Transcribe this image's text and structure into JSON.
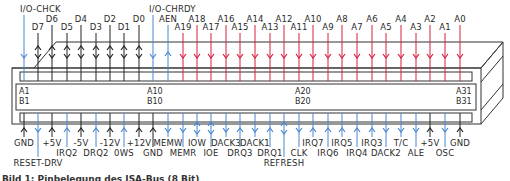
{
  "colors": {
    "output_red": "#d6203f",
    "input_blue": "#4a86d0",
    "bidir_black": "#222222",
    "outline": "#333333"
  },
  "top_pins": [
    {
      "label": "I/O-CHCK",
      "x": 24,
      "labelY": 12,
      "dir": "in",
      "color": "blue"
    },
    {
      "label": "D7",
      "x": 38,
      "labelY": 30,
      "dir": "bi",
      "color": "black"
    },
    {
      "label": "D6",
      "x": 52,
      "labelY": 22,
      "dir": "bi",
      "color": "black"
    },
    {
      "label": "D5",
      "x": 67,
      "labelY": 30,
      "dir": "bi",
      "color": "black"
    },
    {
      "label": "D4",
      "x": 81,
      "labelY": 22,
      "dir": "bi",
      "color": "black"
    },
    {
      "label": "D3",
      "x": 96,
      "labelY": 30,
      "dir": "bi",
      "color": "black"
    },
    {
      "label": "D2",
      "x": 110,
      "labelY": 22,
      "dir": "bi",
      "color": "black"
    },
    {
      "label": "D1",
      "x": 124,
      "labelY": 30,
      "dir": "bi",
      "color": "black"
    },
    {
      "label": "D0",
      "x": 139,
      "labelY": 22,
      "dir": "bi",
      "color": "black"
    },
    {
      "label": "I/O-CHRDY",
      "x": 153,
      "labelY": 12,
      "dir": "in",
      "color": "blue"
    },
    {
      "label": "AEN",
      "x": 168,
      "labelY": 22,
      "dir": "out-up",
      "color": "blue"
    },
    {
      "label": "A19",
      "x": 183,
      "labelY": 30,
      "dir": "out",
      "color": "red"
    },
    {
      "label": "A18",
      "x": 197,
      "labelY": 22,
      "dir": "out",
      "color": "red"
    },
    {
      "label": "A17",
      "x": 211,
      "labelY": 30,
      "dir": "out",
      "color": "red"
    },
    {
      "label": "A16",
      "x": 226,
      "labelY": 22,
      "dir": "out",
      "color": "red"
    },
    {
      "label": "A15",
      "x": 240,
      "labelY": 30,
      "dir": "out",
      "color": "red"
    },
    {
      "label": "A14",
      "x": 255,
      "labelY": 22,
      "dir": "out",
      "color": "red"
    },
    {
      "label": "A13",
      "x": 270,
      "labelY": 30,
      "dir": "out",
      "color": "red"
    },
    {
      "label": "A12",
      "x": 284,
      "labelY": 22,
      "dir": "out",
      "color": "red"
    },
    {
      "label": "A11",
      "x": 299,
      "labelY": 30,
      "dir": "out",
      "color": "red"
    },
    {
      "label": "A10",
      "x": 313,
      "labelY": 22,
      "dir": "out",
      "color": "red"
    },
    {
      "label": "A9",
      "x": 328,
      "labelY": 30,
      "dir": "out",
      "color": "red"
    },
    {
      "label": "A8",
      "x": 342,
      "labelY": 22,
      "dir": "out",
      "color": "red"
    },
    {
      "label": "A7",
      "x": 357,
      "labelY": 30,
      "dir": "out",
      "color": "red"
    },
    {
      "label": "A6",
      "x": 372,
      "labelY": 22,
      "dir": "out",
      "color": "red"
    },
    {
      "label": "A5",
      "x": 386,
      "labelY": 30,
      "dir": "out",
      "color": "red"
    },
    {
      "label": "A4",
      "x": 401,
      "labelY": 22,
      "dir": "out",
      "color": "red"
    },
    {
      "label": "A3",
      "x": 416,
      "labelY": 30,
      "dir": "out",
      "color": "red"
    },
    {
      "label": "A2",
      "x": 430,
      "labelY": 22,
      "dir": "out",
      "color": "red"
    },
    {
      "label": "A1",
      "x": 445,
      "labelY": 30,
      "dir": "out",
      "color": "red"
    },
    {
      "label": "A0",
      "x": 460,
      "labelY": 22,
      "dir": "out",
      "color": "red"
    }
  ],
  "bottom_pins": [
    {
      "label": "GND",
      "x": 24,
      "labelY": 146,
      "dir": "pwr",
      "color": "black"
    },
    {
      "label": "RESET-DRV",
      "x": 38,
      "labelY": 166,
      "dir": "down",
      "color": "blue"
    },
    {
      "label": "+5V",
      "x": 52,
      "labelY": 146,
      "dir": "pwr",
      "color": "black"
    },
    {
      "label": "IRQ2",
      "x": 67,
      "labelY": 156,
      "dir": "up",
      "color": "blue"
    },
    {
      "label": "-5V",
      "x": 81,
      "labelY": 146,
      "dir": "pwr",
      "color": "black"
    },
    {
      "label": "DRQ2",
      "x": 96,
      "labelY": 156,
      "dir": "up",
      "color": "blue"
    },
    {
      "label": "-12V",
      "x": 110,
      "labelY": 146,
      "dir": "pwr",
      "color": "black"
    },
    {
      "label": "0WS",
      "x": 124,
      "labelY": 156,
      "dir": "up",
      "color": "blue"
    },
    {
      "label": "+12V",
      "x": 139,
      "labelY": 146,
      "dir": "pwr",
      "color": "black"
    },
    {
      "label": "GND",
      "x": 153,
      "labelY": 156,
      "dir": "pwr",
      "color": "black"
    },
    {
      "label": "MEMW",
      "x": 168,
      "labelY": 146,
      "dir": "down",
      "color": "blue"
    },
    {
      "label": "MEMR",
      "x": 183,
      "labelY": 156,
      "dir": "down",
      "color": "blue"
    },
    {
      "label": "IOW",
      "x": 197,
      "labelY": 146,
      "dir": "bi",
      "color": "blue"
    },
    {
      "label": "IOE",
      "x": 211,
      "labelY": 156,
      "dir": "bi",
      "color": "blue"
    },
    {
      "label": "DACK3",
      "x": 226,
      "labelY": 146,
      "dir": "down",
      "color": "blue"
    },
    {
      "label": "DRQ3",
      "x": 240,
      "labelY": 156,
      "dir": "up",
      "color": "blue"
    },
    {
      "label": "DACK1",
      "x": 255,
      "labelY": 146,
      "dir": "down",
      "color": "blue"
    },
    {
      "label": "DRQ1",
      "x": 270,
      "labelY": 156,
      "dir": "up",
      "color": "blue"
    },
    {
      "label": "REFRESH",
      "x": 284,
      "labelY": 166,
      "dir": "bi",
      "color": "blue"
    },
    {
      "label": "CLK",
      "x": 299,
      "labelY": 156,
      "dir": "down",
      "color": "blue"
    },
    {
      "label": "IRQ7",
      "x": 313,
      "labelY": 146,
      "dir": "up",
      "color": "blue"
    },
    {
      "label": "IRQ6",
      "x": 328,
      "labelY": 156,
      "dir": "up",
      "color": "blue"
    },
    {
      "label": "IRQ5",
      "x": 342,
      "labelY": 146,
      "dir": "up",
      "color": "blue"
    },
    {
      "label": "IRQ4",
      "x": 357,
      "labelY": 156,
      "dir": "up",
      "color": "blue"
    },
    {
      "label": "IRQ3",
      "x": 372,
      "labelY": 146,
      "dir": "up",
      "color": "blue"
    },
    {
      "label": "DACK2",
      "x": 386,
      "labelY": 156,
      "dir": "down",
      "color": "blue"
    },
    {
      "label": "T/C",
      "x": 401,
      "labelY": 146,
      "dir": "down",
      "color": "blue"
    },
    {
      "label": "ALE",
      "x": 416,
      "labelY": 156,
      "dir": "down",
      "color": "blue"
    },
    {
      "label": "+5V",
      "x": 430,
      "labelY": 146,
      "dir": "pwr",
      "color": "black"
    },
    {
      "label": "OSC",
      "x": 445,
      "labelY": 156,
      "dir": "down",
      "color": "blue"
    },
    {
      "label": "GND",
      "x": 460,
      "labelY": 146,
      "dir": "pwr",
      "color": "black"
    }
  ],
  "slot_labels": {
    "a_first": "A1",
    "b_first": "B1",
    "a_ten": "A10",
    "b_ten": "B10",
    "a_twenty": "A20",
    "b_twenty": "B20",
    "a_last": "A31",
    "b_last": "B31"
  },
  "caption": "Bild 1: Pinbelegung des ISA-Bus (8 Bit)"
}
